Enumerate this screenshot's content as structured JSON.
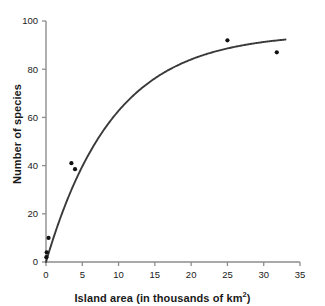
{
  "chart_data": {
    "type": "scatter",
    "title": "",
    "xlabel": "Island area (in thousands of km²)",
    "xlabel_base": "Island area (in thousands of km",
    "xlabel_sup": "2",
    "xlabel_tail": ")",
    "ylabel": "Number of species",
    "xlim": [
      0,
      35
    ],
    "ylim": [
      0,
      100
    ],
    "xticks": [
      0,
      5,
      10,
      15,
      20,
      25,
      30,
      35
    ],
    "yticks": [
      0,
      20,
      40,
      60,
      80,
      100
    ],
    "xtick_labels": [
      "0",
      "5",
      "10",
      "15",
      "20",
      "25",
      "30",
      "35"
    ],
    "ytick_labels": [
      "0",
      "20",
      "40",
      "60",
      "80",
      "100"
    ],
    "grid": false,
    "legend": false,
    "legend_position": "none",
    "marker_color": "#111111",
    "line_color": "#3a3a3a",
    "axis_color": "#888888",
    "points": [
      {
        "x": 0.05,
        "y": 2
      },
      {
        "x": 0.1,
        "y": 4
      },
      {
        "x": 0.35,
        "y": 10
      },
      {
        "x": 3.5,
        "y": 41
      },
      {
        "x": 4.0,
        "y": 38.5
      },
      {
        "x": 25.0,
        "y": 92
      },
      {
        "x": 31.8,
        "y": 87
      }
    ],
    "fit_curve": {
      "label": "saturating species-area curve",
      "model": "S = 95 * (1 - exp(-0.108 * A))",
      "asymptote": 95,
      "rate": 0.108,
      "x_start": 0,
      "x_end": 33.0,
      "samples": [
        {
          "x": 0.0,
          "y": 0
        },
        {
          "x": 0.5,
          "y": 5.0
        },
        {
          "x": 1.0,
          "y": 9.7
        },
        {
          "x": 1.5,
          "y": 14.2
        },
        {
          "x": 2.0,
          "y": 18.5
        },
        {
          "x": 3.0,
          "y": 26.4
        },
        {
          "x": 4.0,
          "y": 33.5
        },
        {
          "x": 5.0,
          "y": 39.8
        },
        {
          "x": 6.0,
          "y": 45.4
        },
        {
          "x": 8.0,
          "y": 54.9
        },
        {
          "x": 10.0,
          "y": 62.7
        },
        {
          "x": 12.0,
          "y": 69.0
        },
        {
          "x": 14.0,
          "y": 74.1
        },
        {
          "x": 16.0,
          "y": 78.1
        },
        {
          "x": 18.0,
          "y": 81.5
        },
        {
          "x": 20.0,
          "y": 84.1
        },
        {
          "x": 22.0,
          "y": 86.2
        },
        {
          "x": 25.0,
          "y": 88.6
        },
        {
          "x": 28.0,
          "y": 90.4
        },
        {
          "x": 31.0,
          "y": 91.6
        },
        {
          "x": 33.0,
          "y": 92.2
        }
      ]
    }
  }
}
